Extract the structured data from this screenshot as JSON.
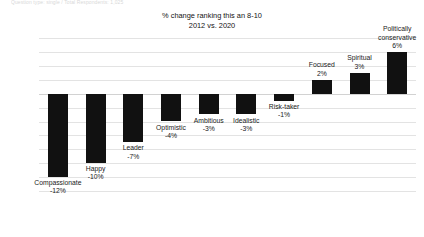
{
  "source_note": "Question type: single / Total Respondents: 1,025",
  "chart_title": {
    "line1": "% change ranking this an 8-10",
    "line2": "2012 vs. 2020"
  },
  "colors": {
    "bar": "#111111",
    "gridline": "#e3e3e3",
    "axis": "#d2d2d2",
    "text": "#1a1a1a"
  },
  "chart_data": {
    "type": "bar",
    "title": "% change ranking this an 8-10 2012 vs. 2020",
    "xlabel": "",
    "ylabel": "",
    "ylim": [
      -14,
      8
    ],
    "ytick_step": 2,
    "grid": true,
    "legend": "none",
    "yticks": [
      "8%",
      "6%",
      "4%",
      "2%",
      "0%",
      "-2%",
      "-4%",
      "-6%",
      "-8%",
      "-10%",
      "-12%",
      "-14%"
    ],
    "categories": [
      "Compassionate",
      "Happy",
      "Leader",
      "Optimistic",
      "Ambitious",
      "Idealistic",
      "Risk-taker",
      "Focused",
      "Spiritual",
      "Politically conservative"
    ],
    "values": [
      -12,
      -10,
      -7,
      -4,
      -3,
      -3,
      -1,
      2,
      3,
      6
    ],
    "value_labels": [
      "-12%",
      "-10%",
      "-7%",
      "-4%",
      "-3%",
      "-3%",
      "-1%",
      "2%",
      "3%",
      "6%"
    ]
  }
}
